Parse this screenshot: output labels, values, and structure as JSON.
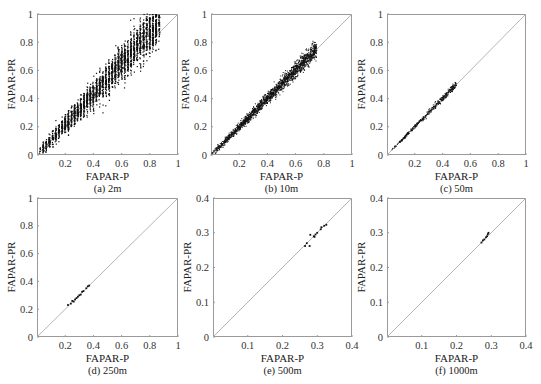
{
  "chart_data": [
    {
      "id": "a",
      "type": "scatter",
      "caption": "(a) 2m",
      "xlabel": "FAPAR-P",
      "ylabel": "FAPAR-PR",
      "xlim": [
        0,
        1
      ],
      "ylim": [
        0,
        1
      ],
      "xticks": [
        0.2,
        0.4,
        0.6,
        0.8,
        1
      ],
      "yticks": [
        0,
        0.2,
        0.4,
        0.6,
        0.8,
        1
      ],
      "reference_line": "y=x",
      "density": "very dense",
      "cloud": {
        "x_range": [
          0.02,
          0.87
        ],
        "spread": 0.16,
        "offset": 0.07,
        "n": 2600,
        "striped": true
      },
      "grid": false
    },
    {
      "id": "b",
      "type": "scatter",
      "caption": "(b) 10m",
      "xlabel": "FAPAR-P",
      "ylabel": "FAPAR-PR",
      "xlim": [
        0,
        1
      ],
      "ylim": [
        0,
        1
      ],
      "xticks": [
        0.2,
        0.4,
        0.6,
        0.8,
        1
      ],
      "yticks": [
        0,
        0.2,
        0.4,
        0.6,
        0.8,
        1
      ],
      "reference_line": "y=x",
      "density": "dense",
      "cloud": {
        "x_range": [
          0.0,
          0.75
        ],
        "spread": 0.07,
        "offset": 0.0,
        "n": 1800,
        "striped": false
      },
      "grid": false
    },
    {
      "id": "c",
      "type": "scatter",
      "caption": "(c) 50m",
      "xlabel": "FAPAR-P",
      "ylabel": "FAPAR-PR",
      "xlim": [
        0,
        1
      ],
      "ylim": [
        0,
        1
      ],
      "xticks": [
        0.2,
        0.4,
        0.6,
        0.8,
        1
      ],
      "yticks": [
        0,
        0.2,
        0.4,
        0.6,
        0.8,
        1
      ],
      "reference_line": "y=x",
      "density": "moderate",
      "cloud": {
        "x_range": [
          0.02,
          0.5
        ],
        "spread": 0.035,
        "offset": 0.0,
        "n": 380,
        "striped": false
      },
      "grid": false
    },
    {
      "id": "d",
      "type": "scatter",
      "caption": "(d) 250m",
      "xlabel": "FAPAR-P",
      "ylabel": "FAPAR-PR",
      "xlim": [
        0,
        1
      ],
      "ylim": [
        0,
        1
      ],
      "xticks": [
        0.2,
        0.4,
        0.6,
        0.8,
        1
      ],
      "yticks": [
        0,
        0.2,
        0.4,
        0.6,
        0.8,
        1
      ],
      "reference_line": "y=x",
      "points": [
        [
          0.22,
          0.23
        ],
        [
          0.24,
          0.24
        ],
        [
          0.25,
          0.26
        ],
        [
          0.26,
          0.255
        ],
        [
          0.27,
          0.27
        ],
        [
          0.28,
          0.28
        ],
        [
          0.29,
          0.29
        ],
        [
          0.3,
          0.3
        ],
        [
          0.31,
          0.305
        ],
        [
          0.32,
          0.325
        ],
        [
          0.33,
          0.33
        ],
        [
          0.35,
          0.35
        ],
        [
          0.36,
          0.365
        ],
        [
          0.37,
          0.37
        ]
      ],
      "grid": false
    },
    {
      "id": "e",
      "type": "scatter",
      "caption": "(e) 500m",
      "xlabel": "FAPAR-P",
      "ylabel": "FAPAR-PR",
      "xlim": [
        0,
        0.4
      ],
      "ylim": [
        0,
        0.4
      ],
      "xticks": [
        0.1,
        0.2,
        0.3,
        0.4
      ],
      "yticks": [
        0,
        0.1,
        0.2,
        0.3,
        0.4
      ],
      "reference_line": "y=x",
      "points": [
        [
          0.265,
          0.262
        ],
        [
          0.27,
          0.27
        ],
        [
          0.278,
          0.262
        ],
        [
          0.28,
          0.294
        ],
        [
          0.29,
          0.29
        ],
        [
          0.292,
          0.288
        ],
        [
          0.295,
          0.295
        ],
        [
          0.3,
          0.3
        ],
        [
          0.31,
          0.31
        ],
        [
          0.312,
          0.316
        ],
        [
          0.32,
          0.32
        ],
        [
          0.326,
          0.323
        ]
      ],
      "grid": false
    },
    {
      "id": "f",
      "type": "scatter",
      "caption": "(f) 1000m",
      "xlabel": "FAPAR-P",
      "ylabel": "FAPAR-PR",
      "xlim": [
        0,
        0.4
      ],
      "ylim": [
        0,
        0.4
      ],
      "xticks": [
        0.1,
        0.2,
        0.3,
        0.4
      ],
      "yticks": [
        0,
        0.1,
        0.2,
        0.3,
        0.4
      ],
      "reference_line": "y=x",
      "points": [
        [
          0.272,
          0.272
        ],
        [
          0.276,
          0.278
        ],
        [
          0.28,
          0.281
        ],
        [
          0.285,
          0.287
        ],
        [
          0.288,
          0.29
        ],
        [
          0.29,
          0.296
        ],
        [
          0.292,
          0.3
        ]
      ],
      "grid": false
    }
  ],
  "layout": {
    "panels": [
      {
        "id": "a",
        "left": 37,
        "top": 14,
        "width": 141,
        "height": 141
      },
      {
        "id": "b",
        "left": 211,
        "top": 14,
        "width": 141,
        "height": 141
      },
      {
        "id": "c",
        "left": 387,
        "top": 14,
        "width": 139,
        "height": 141
      },
      {
        "id": "d",
        "left": 37,
        "top": 198,
        "width": 141,
        "height": 139
      },
      {
        "id": "e",
        "left": 213,
        "top": 198,
        "width": 139,
        "height": 139
      },
      {
        "id": "f",
        "left": 387,
        "top": 198,
        "width": 139,
        "height": 139
      }
    ],
    "colors": {
      "axis": "#9a9a9a",
      "ref_line": "#b5b5b5",
      "points": "#111111"
    }
  }
}
